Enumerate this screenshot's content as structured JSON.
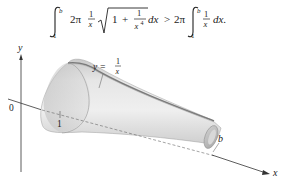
{
  "equation": {
    "lhs": {
      "integral_lower": "1",
      "integral_upper": "b",
      "coefficient": "2π",
      "frac1_num": "1",
      "frac1_den": "x",
      "sqrt_one": "1",
      "plus": "+",
      "frac2_num": "1",
      "frac2_den": "x",
      "frac2_den_exp": "4",
      "differential": "dx"
    },
    "relation": ">",
    "rhs": {
      "coefficient": "2π",
      "integral_lower": "1",
      "integral_upper": "b",
      "frac_num": "1",
      "frac_den": "x",
      "differential": "dx."
    }
  },
  "figure": {
    "y_axis_label": "y",
    "x_axis_label": "x",
    "origin_label": "0",
    "tick_label_1": "1",
    "endpoint_label": "b",
    "curve_label_lhs": "y =",
    "curve_label_num": "1",
    "curve_label_den": "x"
  },
  "colors": {
    "surface_light": "#ececec",
    "surface_mid": "#d6d6d6",
    "surface_dark": "#b8b8b8",
    "axis": "#333333"
  }
}
